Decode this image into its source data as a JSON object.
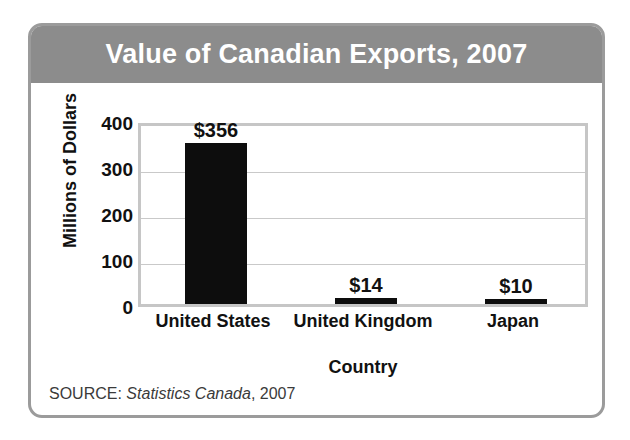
{
  "chart_data": {
    "type": "bar",
    "title": "Value of Canadian Exports, 2007",
    "categories": [
      "United States",
      "United Kingdom",
      "Japan"
    ],
    "values": [
      356,
      14,
      10
    ],
    "data_labels": [
      "$356",
      "$14",
      "$10"
    ],
    "xlabel": "Country",
    "ylabel": "Millions of Dollars",
    "ylim": [
      0,
      400
    ],
    "yticks": [
      400,
      300,
      200,
      100,
      0
    ],
    "ytick_labels": [
      "400",
      "300",
      "200",
      "100",
      "0"
    ],
    "grid": true,
    "legend": "none",
    "bar_color": "#0d0d0d",
    "title_band_color": "#8c8c8c",
    "title_text_color": "#ffffff",
    "plot_border_color": "#c6c6c6",
    "gridline_color": "#c9c9c9",
    "frame_color": "#9b9b9b"
  },
  "source": {
    "prefix": "SOURCE:",
    "publisher": "Statistics Canada",
    "suffix": ", 2007"
  }
}
